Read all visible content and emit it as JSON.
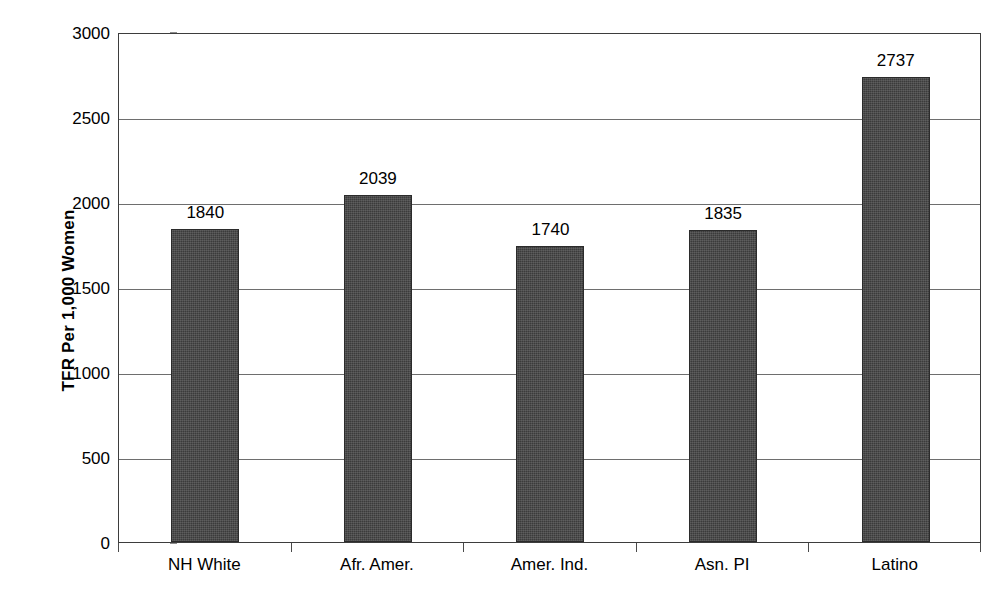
{
  "chart_data": {
    "type": "bar",
    "title": "",
    "subtitle": "",
    "xlabel": "",
    "ylabel": "TFR Per 1,000 Women",
    "categories": [
      "NH White",
      "Afr. Amer.",
      "Amer. Ind.",
      "Asn. PI",
      "Latino"
    ],
    "values": [
      1840,
      2039,
      1740,
      1835,
      2737
    ],
    "data_labels": [
      "1840",
      "2039",
      "1740",
      "1835",
      "2737"
    ],
    "ylim": [
      0,
      3000
    ],
    "y_ticks": [
      0,
      500,
      1000,
      1500,
      2000,
      2500,
      3000
    ],
    "y_tick_labels": [
      "0",
      "500",
      "1000",
      "1500",
      "2000",
      "2500",
      "3000"
    ],
    "grid": true,
    "grid_axis": "y",
    "legend": false,
    "legend_position": "none",
    "bar_color": "#3b3b3b",
    "gridline_color": "#6e6e6e",
    "axis_color": "#3d3d3d",
    "background_color": "#ffffff",
    "text_color": "#000000"
  }
}
